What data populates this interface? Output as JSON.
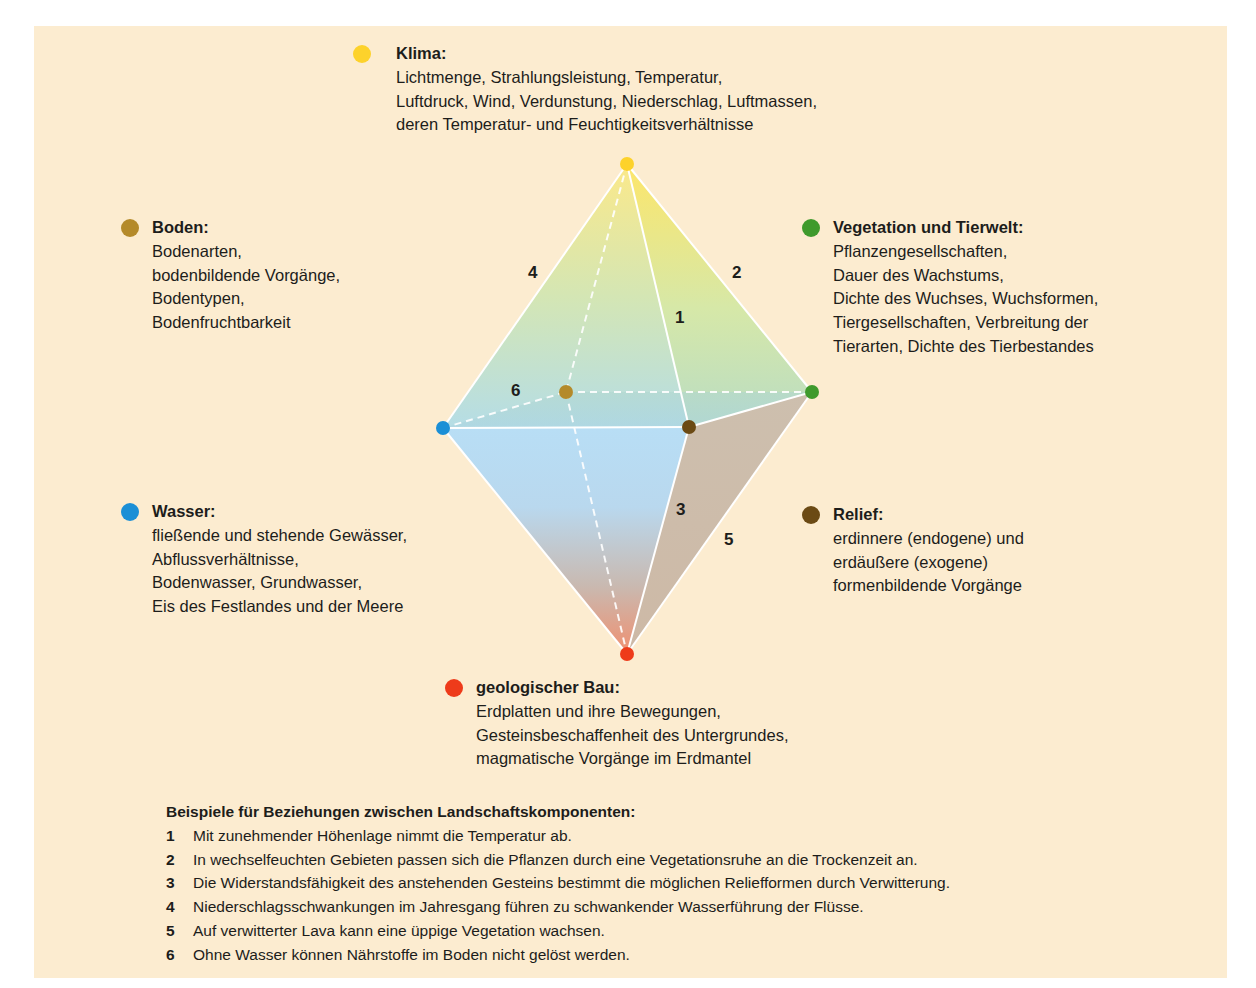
{
  "colors": {
    "background": "#fcecd0",
    "klima": "#fdd22b",
    "boden": "#b48a2a",
    "vegetation": "#3f9a2c",
    "wasser": "#1b8fd6",
    "relief": "#6b4a14",
    "geologie": "#ee3b1a"
  },
  "components": {
    "klima": {
      "title": "Klima:",
      "lines": [
        "Lichtmenge, Strahlungsleistung, Temperatur,",
        "Luftdruck, Wind, Verdunstung, Niederschlag, Luftmassen,",
        "deren Temperatur- und Feuchtigkeitsverhältnisse"
      ]
    },
    "boden": {
      "title": "Boden:",
      "lines": [
        "Bodenarten,",
        "bodenbildende Vorgänge,",
        "Bodentypen,",
        "Bodenfruchtbarkeit"
      ]
    },
    "vegetation": {
      "title": "Vegetation und Tierwelt:",
      "lines": [
        "Pflanzengesellschaften,",
        "Dauer des Wachstums,",
        "Dichte des Wuchses, Wuchsformen,",
        "Tiergesellschaften, Verbreitung der",
        "Tierarten, Dichte des Tierbestandes"
      ]
    },
    "wasser": {
      "title": "Wasser:",
      "lines": [
        "fließende und stehende Gewässer,",
        "Abflussverhältnisse,",
        "Bodenwasser, Grundwasser,",
        "Eis des Festlandes und der Meere"
      ]
    },
    "relief": {
      "title": "Relief:",
      "lines": [
        "erdinnere (endogene) und",
        "erdäußere (exogene)",
        "formenbildende Vorgänge"
      ]
    },
    "geologie": {
      "title": "geologischer Bau:",
      "lines": [
        "Erdplatten und ihre Bewegungen,",
        "Gesteinsbeschaffenheit des Untergrundes,",
        "magmatische Vorgänge im Erdmantel"
      ]
    }
  },
  "edge_labels": {
    "e1": "1",
    "e2": "2",
    "e3": "3",
    "e4": "4",
    "e5": "5",
    "e6": "6"
  },
  "examples": {
    "heading": "Beispiele für Beziehungen zwischen Landschaftskomponenten:",
    "items": [
      {
        "num": "1",
        "text": "Mit zunehmender Höhenlage nimmt die Temperatur ab."
      },
      {
        "num": "2",
        "text": "In wechselfeuchten Gebieten passen sich die Pflanzen durch eine Vegetationsruhe an die Trockenzeit an."
      },
      {
        "num": "3",
        "text": "Die Widerstandsfähigkeit des anstehenden Gesteins bestimmt die möglichen Reliefformen durch Verwitterung."
      },
      {
        "num": "4",
        "text": "Niederschlagsschwankungen im Jahresgang führen zu schwankender Wasserführung der Flüsse."
      },
      {
        "num": "5",
        "text": "Auf verwitterter Lava kann eine üppige Vegetation wachsen."
      },
      {
        "num": "6",
        "text": "Ohne Wasser können Nährstoffe im Boden nicht gelöst werden."
      }
    ]
  }
}
